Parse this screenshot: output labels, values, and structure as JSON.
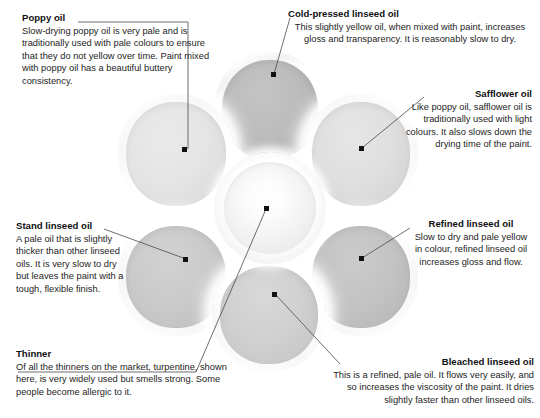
{
  "figure": {
    "wells": [
      {
        "name": "poppy-oil-well",
        "tone": "#e4e4e4"
      },
      {
        "name": "cold-pressed-linseed-oil-well",
        "tone": "#b9b9b9"
      },
      {
        "name": "safflower-oil-well",
        "tone": "#dedede"
      },
      {
        "name": "refined-linseed-oil-well",
        "tone": "#c3c3c3"
      },
      {
        "name": "bleached-linseed-oil-well",
        "tone": "#cfcfcf"
      },
      {
        "name": "stand-linseed-oil-well",
        "tone": "#c9c9c9"
      },
      {
        "name": "thinner-centre-well",
        "tone": "#f0f0f0"
      }
    ]
  },
  "captions": {
    "poppy": {
      "title": "Poppy oil",
      "body": "Slow-drying poppy oil is very pale and is traditionally used with pale colours to ensure that they do not yellow over time. Paint mixed with poppy oil has a beautiful buttery consistency."
    },
    "cold_pressed": {
      "title": "Cold-pressed linseed oil",
      "body": "This slightly yellow oil, when mixed with paint, increases gloss and transparency. It is reasonably slow to dry."
    },
    "safflower": {
      "title": "Safflower oil",
      "body": "Like poppy oil, safflower oil is traditionally used with light colours. It also slows down the drying time of the paint."
    },
    "refined": {
      "title": "Refined linseed oil",
      "body": "Slow to dry and pale yellow in colour, refined linseed oil increases gloss and flow."
    },
    "bleached": {
      "title": "Bleached linseed oil",
      "body": "This is a refined, pale oil. It flows very easily, and so increases the viscosity of the paint. It dries slightly faster than other linseed oils."
    },
    "thinner": {
      "title": "Thinner",
      "body": "Of all the thinners on the market, turpentine, shown here, is very widely used but smells strong. Some people become allergic to it."
    },
    "stand": {
      "title": "Stand linseed oil",
      "body": "A pale oil that is slightly thicker than other linseed oils. It is very slow to dry but leaves the paint with a tough, flexible finish."
    }
  }
}
